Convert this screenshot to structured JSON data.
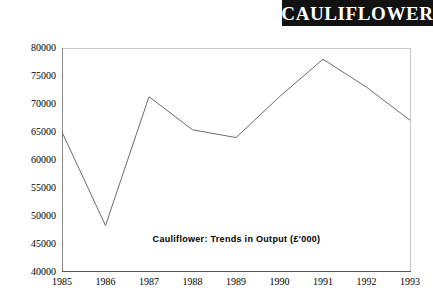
{
  "banner": {
    "title": "CAULIFLOWER",
    "background_color": "#121212",
    "text_color": "#ffffff"
  },
  "chart_data": {
    "type": "line",
    "title": "Cauliflower: Trends in Output (£'000)",
    "caption": "Cauliflower: Trends in Output (£'000)",
    "xlabel": "",
    "ylabel": "",
    "categories": [
      "1985",
      "1986",
      "1987",
      "1988",
      "1989",
      "1990",
      "1991",
      "1992",
      "1993"
    ],
    "x": [
      1985,
      1986,
      1987,
      1988,
      1989,
      1990,
      1991,
      1992,
      1993
    ],
    "values": [
      65000,
      48300,
      71300,
      65400,
      64000,
      71300,
      78000,
      73000,
      67100
    ],
    "series": [
      {
        "name": "Cauliflower output",
        "values": [
          65000,
          48300,
          71300,
          65400,
          64000,
          71300,
          78000,
          73000,
          67100
        ]
      }
    ],
    "ylim": [
      40000,
      80000
    ],
    "ytick_values": [
      80000,
      75000,
      70000,
      65000,
      60000,
      55000,
      50000,
      45000,
      40000
    ],
    "ytick_labels": [
      "80000",
      "75000",
      "70000",
      "65000",
      "60000",
      "55000",
      "50000",
      "45000",
      "40000"
    ],
    "xtick_labels": [
      "1985",
      "1986",
      "1987",
      "1988",
      "1989",
      "1990",
      "1991",
      "1992",
      "1993"
    ],
    "grid": false,
    "legend": "none",
    "line_color": "#6b6b6b",
    "frame_color": "#c8c8c8",
    "axis_color": "#555555"
  }
}
